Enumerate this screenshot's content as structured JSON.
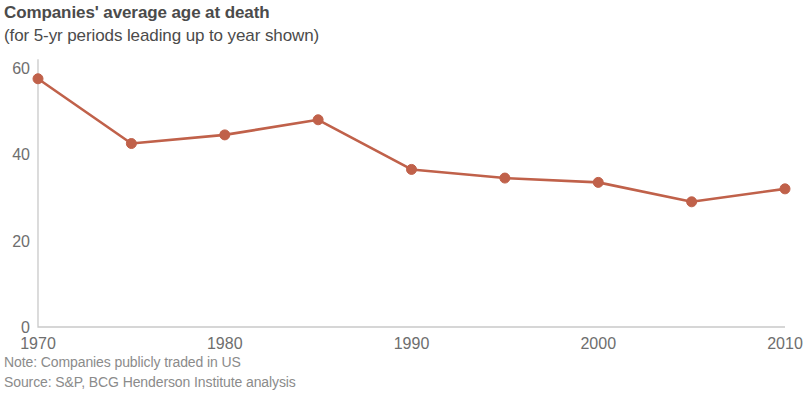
{
  "header": {
    "title": "Companies' average age at death",
    "subtitle": "(for 5-yr periods leading up to year shown)"
  },
  "footer": {
    "note": "Note: Companies publicly traded in US",
    "source": "Source: S&P, BCG Henderson Institute analysis"
  },
  "style": {
    "series_color": "#c0614a",
    "axis_color": "#c9c9c9",
    "tick_label_color": "#6e6e6e",
    "title_color": "#4b4b4b",
    "footnote_color": "#8b8b8b",
    "background": "#ffffff"
  },
  "chart_data": {
    "type": "line",
    "title": "Companies' average age at death",
    "subtitle": "(for 5-yr periods leading up to year shown)",
    "xlabel": "",
    "ylabel": "",
    "x": [
      1970,
      1975,
      1980,
      1985,
      1990,
      1995,
      2000,
      2005,
      2010
    ],
    "values": [
      57.5,
      42.5,
      44.5,
      48.0,
      36.5,
      34.5,
      33.5,
      29.0,
      32.0
    ],
    "series": [
      {
        "name": "Average age at death",
        "values": [
          57.5,
          42.5,
          44.5,
          48.0,
          36.5,
          34.5,
          33.5,
          29.0,
          32.0
        ]
      }
    ],
    "xlim": [
      1970,
      2010
    ],
    "ylim": [
      0,
      62
    ],
    "xticks": [
      1970,
      1980,
      1990,
      2000,
      2010
    ],
    "xtick_labels": [
      "1970",
      "1980",
      "1990",
      "2000",
      "2010"
    ],
    "yticks": [
      0,
      20,
      40,
      60
    ],
    "ytick_labels": [
      "0",
      "20",
      "40",
      "60"
    ],
    "grid": false,
    "legend": false,
    "markers": true,
    "marker_size": 5,
    "line_width": 2.6
  }
}
